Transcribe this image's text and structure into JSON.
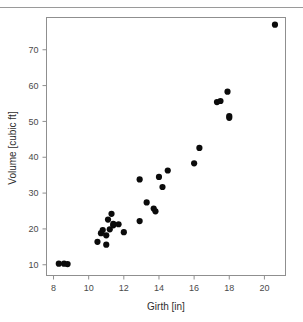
{
  "figure": {
    "background_color": "#ffffff",
    "frame_color": "#8f8f8f",
    "point_color": "#0b0b0b",
    "tick_label_color": "#4a4a4a",
    "axis_title_color": "#2e2e2e",
    "top_rule_color": "#9a9a9a"
  },
  "chart_data": {
    "type": "scatter",
    "title": "",
    "xlabel": "Girth [in]",
    "ylabel": "Volume [cubic ft]",
    "xlim": [
      7.6,
      21.2
    ],
    "ylim": [
      7.0,
      79.0
    ],
    "xticks": [
      8,
      10,
      12,
      14,
      16,
      18,
      20
    ],
    "xtick_labels": [
      "8",
      "10",
      "12",
      "14",
      "16",
      "18",
      "20"
    ],
    "yticks": [
      10,
      20,
      30,
      40,
      50,
      60,
      70
    ],
    "ytick_labels": [
      "10",
      "20",
      "30",
      "40",
      "50",
      "60",
      "70"
    ],
    "grid": false,
    "legend": false,
    "marker": "filled-circle",
    "marker_size_px": 3.1,
    "n_points": 31,
    "x": [
      8.3,
      8.6,
      8.8,
      10.5,
      10.7,
      10.8,
      11.0,
      11.0,
      11.1,
      11.2,
      11.3,
      11.4,
      11.4,
      11.7,
      12.0,
      12.9,
      12.9,
      13.3,
      13.7,
      13.8,
      14.0,
      14.2,
      14.5,
      16.0,
      16.3,
      17.3,
      17.5,
      17.9,
      18.0,
      18.0,
      20.6
    ],
    "y": [
      10.3,
      10.3,
      10.2,
      16.4,
      18.8,
      19.7,
      15.6,
      18.2,
      22.6,
      19.9,
      24.2,
      21.0,
      21.4,
      21.3,
      19.1,
      22.2,
      33.8,
      27.4,
      25.7,
      24.9,
      34.5,
      31.7,
      36.3,
      38.3,
      42.6,
      55.4,
      55.7,
      58.3,
      51.5,
      51.0,
      77.0
    ],
    "points": [
      {
        "x": 8.3,
        "y": 10.3
      },
      {
        "x": 8.6,
        "y": 10.3
      },
      {
        "x": 8.8,
        "y": 10.2
      },
      {
        "x": 10.5,
        "y": 16.4
      },
      {
        "x": 10.7,
        "y": 18.8
      },
      {
        "x": 10.8,
        "y": 19.7
      },
      {
        "x": 11.0,
        "y": 15.6
      },
      {
        "x": 11.0,
        "y": 18.2
      },
      {
        "x": 11.1,
        "y": 22.6
      },
      {
        "x": 11.2,
        "y": 19.9
      },
      {
        "x": 11.3,
        "y": 24.2
      },
      {
        "x": 11.4,
        "y": 21.0
      },
      {
        "x": 11.4,
        "y": 21.4
      },
      {
        "x": 11.7,
        "y": 21.3
      },
      {
        "x": 12.0,
        "y": 19.1
      },
      {
        "x": 12.9,
        "y": 22.2
      },
      {
        "x": 12.9,
        "y": 33.8
      },
      {
        "x": 13.3,
        "y": 27.4
      },
      {
        "x": 13.7,
        "y": 25.7
      },
      {
        "x": 13.8,
        "y": 24.9
      },
      {
        "x": 14.0,
        "y": 34.5
      },
      {
        "x": 14.2,
        "y": 31.7
      },
      {
        "x": 14.5,
        "y": 36.3
      },
      {
        "x": 16.0,
        "y": 38.3
      },
      {
        "x": 16.3,
        "y": 42.6
      },
      {
        "x": 17.3,
        "y": 55.4
      },
      {
        "x": 17.5,
        "y": 55.7
      },
      {
        "x": 17.9,
        "y": 58.3
      },
      {
        "x": 18.0,
        "y": 51.5
      },
      {
        "x": 18.0,
        "y": 51.0
      },
      {
        "x": 20.6,
        "y": 77.0
      }
    ]
  }
}
